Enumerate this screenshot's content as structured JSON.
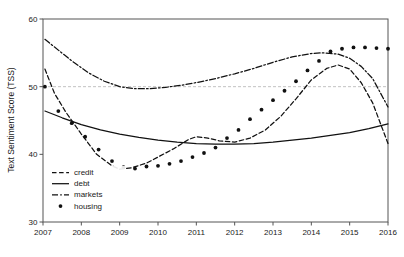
{
  "chart_data": {
    "type": "line",
    "title": "",
    "xlabel": "",
    "ylabel": "Text Sentiment Score (TSS)",
    "xlim": [
      2007,
      2016
    ],
    "ylim": [
      30,
      60
    ],
    "yticks": [
      30,
      40,
      50,
      60
    ],
    "ytick_labels": [
      "30",
      "40",
      "50",
      "60"
    ],
    "xticks": [
      2007,
      2008,
      2009,
      2010,
      2011,
      2012,
      2013,
      2014,
      2015,
      2016
    ],
    "xtick_labels": [
      "2007",
      "2008",
      "2009",
      "2010",
      "2011",
      "2012",
      "2013",
      "2014",
      "2015",
      "2016"
    ],
    "grid": false,
    "reference_line": {
      "value": 50,
      "style": "dashed",
      "color": "#b4b4b4"
    },
    "legend_position": "lower left",
    "frame_color": "#555555",
    "series": [
      {
        "name": "credit",
        "style": "dashed",
        "color": "#111111",
        "x": [
          2007.05,
          2007.3,
          2007.6,
          2008.0,
          2008.4,
          2008.8,
          2009.0,
          2009.3,
          2009.7,
          2010.0,
          2010.4,
          2010.8,
          2011.0,
          2011.3,
          2011.6,
          2012.0,
          2012.4,
          2012.8,
          2013.2,
          2013.6,
          2014.0,
          2014.4,
          2014.7,
          2015.0,
          2015.3,
          2015.6,
          2016.0
        ],
        "values": [
          52.6,
          49.0,
          46.2,
          43.0,
          40.0,
          38.3,
          37.8,
          38.0,
          38.7,
          39.6,
          40.8,
          42.2,
          42.6,
          42.4,
          42.0,
          41.8,
          42.4,
          43.6,
          45.6,
          48.2,
          51.0,
          52.7,
          53.2,
          52.6,
          50.6,
          47.6,
          41.6
        ]
      },
      {
        "name": "debt",
        "style": "solid",
        "color": "#111111",
        "x": [
          2007.05,
          2007.5,
          2008.0,
          2008.5,
          2009.0,
          2009.5,
          2010.0,
          2010.5,
          2011.0,
          2011.5,
          2012.0,
          2012.5,
          2013.0,
          2013.5,
          2014.0,
          2014.5,
          2015.0,
          2015.5,
          2016.0
        ],
        "values": [
          46.4,
          45.4,
          44.4,
          43.6,
          43.0,
          42.5,
          42.1,
          41.8,
          41.6,
          41.5,
          41.5,
          41.6,
          41.8,
          42.1,
          42.4,
          42.8,
          43.2,
          43.8,
          44.5
        ]
      },
      {
        "name": "markets",
        "style": "dashdot",
        "color": "#111111",
        "x": [
          2007.05,
          2007.4,
          2007.8,
          2008.2,
          2008.6,
          2009.0,
          2009.4,
          2009.8,
          2010.2,
          2010.6,
          2011.0,
          2011.5,
          2012.0,
          2012.5,
          2013.0,
          2013.5,
          2014.0,
          2014.3,
          2014.7,
          2015.0,
          2015.3,
          2015.6,
          2016.0
        ],
        "values": [
          57.0,
          55.4,
          53.6,
          52.0,
          50.8,
          50.0,
          49.7,
          49.7,
          49.9,
          50.2,
          50.6,
          51.2,
          51.9,
          52.7,
          53.6,
          54.4,
          54.9,
          55.0,
          54.8,
          54.2,
          53.0,
          51.2,
          47.0
        ]
      },
      {
        "name": "housing",
        "style": "dots",
        "color": "#111111",
        "x": [
          2007.05,
          2007.4,
          2007.75,
          2008.1,
          2008.45,
          2008.8,
          2009.1,
          2009.4,
          2009.7,
          2010.0,
          2010.3,
          2010.6,
          2010.9,
          2011.2,
          2011.5,
          2011.8,
          2012.1,
          2012.4,
          2012.7,
          2013.0,
          2013.3,
          2013.6,
          2013.9,
          2014.2,
          2014.5,
          2014.8,
          2015.1,
          2015.4,
          2015.7,
          2016.0
        ],
        "values": [
          50.0,
          46.4,
          44.6,
          42.6,
          40.7,
          39.0,
          38.1,
          37.9,
          38.2,
          38.3,
          38.6,
          39.0,
          39.6,
          40.2,
          41.0,
          42.4,
          43.6,
          45.2,
          46.6,
          48.0,
          49.4,
          50.8,
          52.4,
          53.8,
          55.2,
          55.6,
          55.8,
          55.8,
          55.7,
          55.6
        ]
      }
    ]
  },
  "legend": {
    "items": [
      {
        "label": "credit",
        "marker": "dashed-line-swatch"
      },
      {
        "label": "debt",
        "marker": "solid-line-swatch"
      },
      {
        "label": "markets",
        "marker": "dashdot-line-swatch"
      },
      {
        "label": "housing",
        "marker": "dot-marker-swatch"
      }
    ]
  }
}
